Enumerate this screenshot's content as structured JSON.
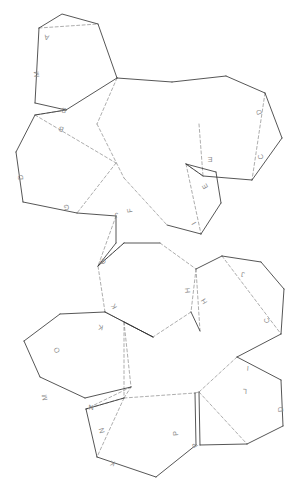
{
  "figure": {
    "canvas": {
      "width": 306,
      "height": 502
    },
    "background_color": "#ffffff",
    "cut_line_color": "#2b2b2b",
    "fold_line_color": "#8a8a8a",
    "label_color": "#8d8d8d"
  },
  "faces": [
    {
      "id": "face-top-pentagon",
      "name": "top-pentagon",
      "points": "39,28 62,14 98,24 117,78 66,110 35,103"
    },
    {
      "id": "face-upper-left-hexagon",
      "name": "upper-left-hexagon",
      "points": "35,115 66,110 116,163 97,192 77,213 23,202 16,152"
    },
    {
      "id": "face-upper-center-hexagon",
      "name": "upper-center-hexagon",
      "points": "117,78 172,82 199,124 186,164 124,178 97,124"
    },
    {
      "id": "face-right-hexagon",
      "name": "right-hexagon",
      "points": "172,82 226,76 265,93 282,138 252,180 203,176 199,124"
    },
    {
      "id": "face-mid-pentagon",
      "name": "mid-pentagon",
      "points": "186,164 216,172 221,203 201,234 167,225 124,178"
    },
    {
      "id": "face-center-hexagon",
      "name": "center-hexagon",
      "points": "124,243 160,243 196,269 191,312 153,337 105,312 98,266"
    },
    {
      "id": "face-lower-right-hexagon",
      "name": "lower-right-hexagon",
      "points": "196,269 222,256 261,262 284,289 281,334 237,357 200,331"
    },
    {
      "id": "face-lower-left-hexagon",
      "name": "lower-left-hexagon",
      "points": "105,312 124,322 131,387 85,398 40,377 24,341 60,314"
    },
    {
      "id": "face-center-lower-pentagon",
      "name": "center-lower-pentagon",
      "points": "153,337 191,312 200,331 195,390 131,398 124,322"
    },
    {
      "id": "face-bottom-pentagon",
      "name": "bottom-pentagon",
      "points": "124,398 195,393 196,445 156,477 97,457 86,409"
    },
    {
      "id": "face-bottom-right-pentagon",
      "name": "bottom-right-pentagon",
      "points": "199,392 237,357 281,380 283,426 247,444 200,445"
    }
  ],
  "cut_paths": [
    "M39,28 L62,14 L98,24",
    "M98,24 L117,78",
    "M35,103 L66,110",
    "M39,28 L35,103",
    "M66,110 L117,78",
    "M35,115 L66,110",
    "M35,115 L16,152",
    "M16,152 L23,202",
    "M23,202 L77,213",
    "M77,213 L116,216",
    "M117,78 L172,82",
    "M172,82 L226,76",
    "M226,76 L265,93",
    "M265,93 L282,138",
    "M282,138 L252,180",
    "M252,180 L203,176",
    "M203,176 L186,164",
    "M186,164 L216,172",
    "M216,172 L221,203",
    "M221,203 L201,234",
    "M201,234 L167,225",
    "M116,216 L116,243",
    "M116,243 L98,266",
    "M98,266 L124,243",
    "M124,243 L160,243",
    "M196,269 L222,256",
    "M222,256 L261,262",
    "M261,262 L284,289",
    "M284,289 L281,334",
    "M281,334 L237,357",
    "M237,357 L281,380",
    "M281,380 L283,426",
    "M283,426 L247,444",
    "M247,444 L200,445",
    "M200,445 L199,392",
    "M105,312 L60,314",
    "M60,314 L24,341",
    "M24,341 L40,377",
    "M40,377 L85,398",
    "M85,398 L131,387",
    "M86,409 L97,457",
    "M97,457 L156,477",
    "M156,477 L196,445",
    "M196,445 L195,393",
    "M124,398 L86,409",
    "M105,312 L153,337",
    "M153,337 L124,322",
    "M191,312 L200,331"
  ],
  "fold_paths": [
    "M39,28 L98,24",
    "M66,110 L35,115",
    "M35,115 L116,163",
    "M116,163 L77,213",
    "M117,78 L97,124",
    "M97,124 L124,178",
    "M199,124 L203,176",
    "M186,164 L203,176",
    "M265,93 L252,180",
    "M186,164 L201,234",
    "M124,178 L167,225",
    "M116,216 L98,266",
    "M124,243 L98,266",
    "M160,243 L196,269",
    "M196,269 L191,312",
    "M191,312 L153,337",
    "M153,337 L105,312",
    "M105,312 L98,266",
    "M196,269 L200,331",
    "M222,256 L281,334",
    "M237,357 L199,392",
    "M105,312 L124,322",
    "M124,322 L131,387",
    "M124,322 L124,398",
    "M124,398 L131,387",
    "M124,398 L195,393",
    "M131,387 L86,409",
    "M195,393 L199,392",
    "M199,392 L247,444",
    "M124,398 L86,409",
    "M124,398 L97,457"
  ],
  "edge_labels": [
    {
      "text": "A",
      "x": 47,
      "y": 35,
      "rotate": -170
    },
    {
      "text": "M",
      "x": 39,
      "y": 74,
      "rotate": -95
    },
    {
      "text": "B",
      "x": 64,
      "y": 108,
      "rotate": -172
    },
    {
      "text": "B",
      "x": 62,
      "y": 127,
      "rotate": -160
    },
    {
      "text": "D",
      "x": 23,
      "y": 177,
      "rotate": -95
    },
    {
      "text": "G",
      "x": 66,
      "y": 205,
      "rotate": -184
    },
    {
      "text": "D",
      "x": 261,
      "y": 111,
      "rotate": -115
    },
    {
      "text": "C",
      "x": 263,
      "y": 156,
      "rotate": -108
    },
    {
      "text": "E",
      "x": 210,
      "y": 157,
      "rotate": -180
    },
    {
      "text": "E",
      "x": 207,
      "y": 185,
      "rotate": -120
    },
    {
      "text": "J",
      "x": 116,
      "y": 213,
      "rotate": -185
    },
    {
      "text": "F",
      "x": 132,
      "y": 210,
      "rotate": -100
    },
    {
      "text": "I",
      "x": 196,
      "y": 222,
      "rotate": -120
    },
    {
      "text": "G",
      "x": 105,
      "y": 260,
      "rotate": -120
    },
    {
      "text": "H",
      "x": 190,
      "y": 290,
      "rotate": -96
    },
    {
      "text": "H",
      "x": 206,
      "y": 300,
      "rotate": -122
    },
    {
      "text": "J",
      "x": 243,
      "y": 272,
      "rotate": -172
    },
    {
      "text": "C",
      "x": 269,
      "y": 320,
      "rotate": -98
    },
    {
      "text": "I",
      "x": 248,
      "y": 366,
      "rotate": -175
    },
    {
      "text": "L",
      "x": 245,
      "y": 389,
      "rotate": -178
    },
    {
      "text": "D",
      "x": 283,
      "y": 409,
      "rotate": -96
    },
    {
      "text": "K",
      "x": 116,
      "y": 305,
      "rotate": -120
    },
    {
      "text": "K",
      "x": 101,
      "y": 325,
      "rotate": -170
    },
    {
      "text": "O",
      "x": 59,
      "y": 349,
      "rotate": -118
    },
    {
      "text": "M",
      "x": 47,
      "y": 397,
      "rotate": -100
    },
    {
      "text": "N",
      "x": 91,
      "y": 405,
      "rotate": -178
    },
    {
      "text": "N",
      "x": 104,
      "y": 430,
      "rotate": -105
    },
    {
      "text": "K",
      "x": 113,
      "y": 461,
      "rotate": -164
    },
    {
      "text": "P",
      "x": 178,
      "y": 433,
      "rotate": -96
    },
    {
      "text": "P",
      "x": 197,
      "y": 444,
      "rotate": -122
    }
  ]
}
